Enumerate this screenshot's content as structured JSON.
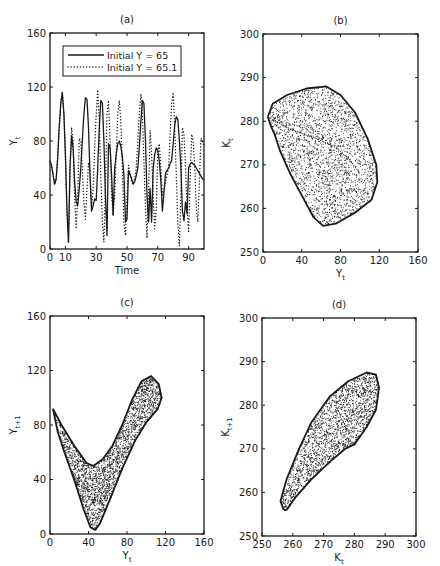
{
  "chart_data": [
    {
      "id": "a",
      "type": "line",
      "title": "(a)",
      "xlabel": "Time",
      "ylabel": "Y_t",
      "xlim": [
        0,
        100
      ],
      "ylim": [
        0,
        160
      ],
      "xticks": [
        0,
        10,
        30,
        50,
        70,
        90
      ],
      "yticks": [
        0,
        40,
        80,
        120,
        160
      ],
      "grid": false,
      "legend_position": "upper center (inside)",
      "box": {
        "left": 50,
        "top": 33,
        "right": 204,
        "bottom": 249
      },
      "series": [
        {
          "name": "Initial Y = 65",
          "style": "solid",
          "x": [
            0,
            1,
            2,
            3,
            4,
            5,
            6,
            7,
            8,
            9,
            10,
            11,
            12,
            13,
            14,
            15,
            16,
            17,
            18,
            19,
            20,
            21,
            22,
            23,
            24,
            25,
            26,
            27,
            28,
            29,
            30,
            31,
            32,
            33,
            34,
            35,
            36,
            37,
            38,
            39,
            40,
            41,
            42,
            43,
            44,
            45,
            46,
            47,
            48,
            49,
            50,
            51,
            52,
            53,
            54,
            55,
            56,
            57,
            58,
            59,
            60,
            61,
            62,
            63,
            64,
            65,
            66,
            67,
            68,
            69,
            70,
            71,
            72,
            73,
            74,
            75,
            76,
            77,
            78,
            79,
            80,
            81,
            82,
            83,
            84,
            85,
            86,
            87,
            88,
            89,
            90,
            91,
            92,
            93,
            94,
            95,
            96,
            97,
            98,
            99,
            100
          ],
          "values": [
            65,
            62,
            55,
            48,
            52,
            68,
            90,
            108,
            116,
            100,
            70,
            30,
            5,
            60,
            84,
            75,
            50,
            35,
            32,
            45,
            60,
            80,
            100,
            112,
            111,
            90,
            55,
            28,
            32,
            37,
            36,
            60,
            90,
            110,
            108,
            80,
            40,
            10,
            78,
            75,
            55,
            25,
            60,
            70,
            78,
            80,
            76,
            68,
            55,
            20,
            22,
            58,
            55,
            52,
            48,
            50,
            54,
            60,
            75,
            95,
            110,
            108,
            80,
            40,
            20,
            45,
            20,
            60,
            70,
            75,
            73,
            65,
            50,
            28,
            42,
            56,
            58,
            60,
            63,
            66,
            78,
            92,
            98,
            96,
            80,
            60,
            28,
            21,
            35,
            26,
            60,
            63,
            64,
            63,
            62,
            60,
            58,
            56,
            54,
            52,
            51
          ]
        },
        {
          "name": "Initial Y = 65.1",
          "style": "dotted",
          "x": [
            0,
            1,
            2,
            3,
            4,
            5,
            6,
            7,
            8,
            9,
            10,
            11,
            12,
            13,
            14,
            15,
            16,
            17,
            18,
            19,
            20,
            21,
            22,
            23,
            24,
            25,
            26,
            27,
            28,
            29,
            30,
            31,
            32,
            33,
            34,
            35,
            36,
            37,
            38,
            39,
            40,
            41,
            42,
            43,
            44,
            45,
            46,
            47,
            48,
            49,
            50,
            51,
            52,
            53,
            54,
            55,
            56,
            57,
            58,
            59,
            60,
            61,
            62,
            63,
            64,
            65,
            66,
            67,
            68,
            69,
            70,
            71,
            72,
            73,
            74,
            75,
            76,
            77,
            78,
            79,
            80,
            81,
            82,
            83,
            84,
            85,
            86,
            87,
            88,
            89,
            90,
            91,
            92,
            93,
            94,
            95,
            96,
            97,
            98,
            99,
            100
          ],
          "values": [
            65,
            62,
            55,
            48,
            52,
            68,
            90,
            108,
            116,
            100,
            70,
            30,
            5,
            60,
            90,
            80,
            40,
            15,
            40,
            82,
            80,
            60,
            35,
            22,
            45,
            64,
            58,
            30,
            45,
            75,
            100,
            118,
            95,
            55,
            20,
            5,
            45,
            100,
            110,
            80,
            40,
            25,
            40,
            70,
            100,
            110,
            95,
            60,
            20,
            10,
            40,
            62,
            56,
            50,
            48,
            52,
            60,
            80,
            100,
            115,
            100,
            65,
            30,
            8,
            40,
            88,
            70,
            40,
            15,
            30,
            72,
            78,
            60,
            40,
            44,
            50,
            55,
            60,
            85,
            108,
            116,
            90,
            55,
            20,
            2,
            40,
            90,
            85,
            60,
            30,
            12,
            50,
            85,
            80,
            60,
            30,
            20,
            50,
            82,
            80,
            76
          ]
        }
      ]
    },
    {
      "id": "b",
      "type": "scatter",
      "title": "(b)",
      "xlabel": "Y_t",
      "ylabel": "K_t",
      "xlim": [
        0,
        160
      ],
      "ylim": [
        250,
        300
      ],
      "xticks": [
        0,
        40,
        80,
        120,
        160
      ],
      "yticks": [
        250,
        260,
        270,
        280,
        290,
        300
      ],
      "grid": false,
      "box": {
        "left": 263,
        "top": 34,
        "right": 418,
        "bottom": 252
      },
      "outline": [
        [
          5,
          281
        ],
        [
          10,
          284
        ],
        [
          25,
          286
        ],
        [
          45,
          287.5
        ],
        [
          65,
          288
        ],
        [
          80,
          286
        ],
        [
          95,
          282
        ],
        [
          108,
          276
        ],
        [
          117,
          270
        ],
        [
          118,
          266
        ],
        [
          112,
          262
        ],
        [
          95,
          259
        ],
        [
          75,
          256.5
        ],
        [
          62,
          256
        ],
        [
          52,
          258
        ],
        [
          40,
          263
        ],
        [
          28,
          268
        ],
        [
          18,
          273
        ],
        [
          12,
          277
        ],
        [
          8,
          279
        ],
        [
          5,
          281
        ]
      ],
      "inner_curve": [
        [
          5,
          281
        ],
        [
          30,
          278
        ],
        [
          55,
          276
        ],
        [
          75,
          274
        ],
        [
          90,
          271
        ],
        [
          100,
          268
        ]
      ],
      "n_points": 2200
    },
    {
      "id": "c",
      "type": "scatter",
      "title": "(c)",
      "xlabel": "Y_t",
      "ylabel": "Y_t+1",
      "xlim": [
        0,
        160
      ],
      "ylim": [
        0,
        160
      ],
      "xticks": [
        0,
        40,
        80,
        120,
        160
      ],
      "yticks": [
        0,
        40,
        80,
        120,
        160
      ],
      "grid": false,
      "box": {
        "left": 50,
        "top": 316,
        "right": 204,
        "bottom": 534
      },
      "outline": [
        [
          3,
          92
        ],
        [
          12,
          80
        ],
        [
          25,
          65
        ],
        [
          38,
          52
        ],
        [
          45,
          50
        ],
        [
          55,
          55
        ],
        [
          65,
          65
        ],
        [
          75,
          80
        ],
        [
          85,
          98
        ],
        [
          95,
          112
        ],
        [
          105,
          116
        ],
        [
          113,
          110
        ],
        [
          116,
          100
        ],
        [
          112,
          92
        ],
        [
          100,
          82
        ],
        [
          88,
          68
        ],
        [
          75,
          48
        ],
        [
          62,
          25
        ],
        [
          52,
          8
        ],
        [
          47,
          3
        ],
        [
          42,
          5
        ],
        [
          35,
          18
        ],
        [
          25,
          40
        ],
        [
          15,
          60
        ],
        [
          8,
          75
        ],
        [
          3,
          92
        ]
      ],
      "n_points": 2400
    },
    {
      "id": "d",
      "type": "scatter",
      "title": "(d)",
      "xlabel": "K_t",
      "ylabel": "K_t+1",
      "xlim": [
        250,
        300
      ],
      "ylim": [
        250,
        300
      ],
      "xticks": [
        250,
        260,
        270,
        280,
        290,
        300
      ],
      "yticks": [
        250,
        260,
        270,
        280,
        290,
        300
      ],
      "grid": false,
      "box": {
        "left": 262,
        "top": 318,
        "right": 416,
        "bottom": 536
      },
      "outline": [
        [
          257,
          256
        ],
        [
          256,
          258
        ],
        [
          258,
          263
        ],
        [
          262,
          270
        ],
        [
          266,
          276
        ],
        [
          272,
          282
        ],
        [
          278,
          285.5
        ],
        [
          284,
          287.5
        ],
        [
          287,
          287
        ],
        [
          288,
          284
        ],
        [
          287,
          279
        ],
        [
          284,
          275
        ],
        [
          280,
          271
        ],
        [
          277,
          270
        ],
        [
          272,
          267
        ],
        [
          266,
          263
        ],
        [
          261,
          259
        ],
        [
          258,
          256
        ],
        [
          257,
          256
        ]
      ],
      "n_points": 2000
    }
  ],
  "figure": {
    "background": "#ffffff",
    "ink": "#1a1a1a",
    "panel_titles": [
      "(a)",
      "(b)",
      "(c)",
      "(d)"
    ]
  }
}
